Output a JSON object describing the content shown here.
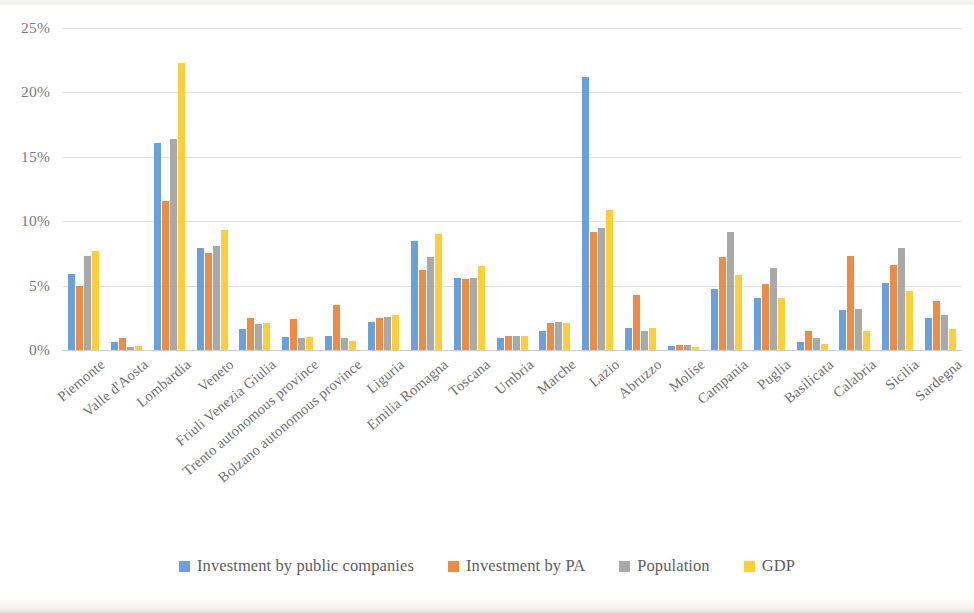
{
  "chart_data": {
    "type": "bar",
    "title": "",
    "subtitle": "",
    "xlabel": "",
    "ylabel": "",
    "ylim": [
      0,
      25
    ],
    "y_tick_step": 5,
    "grid": true,
    "legend_position": "bottom",
    "y_ticks": [
      "0%",
      "5%",
      "10%",
      "15%",
      "20%",
      "25%"
    ],
    "categories": [
      "Piemonte",
      "Valle d'Aosta",
      "Lombardia",
      "Veneto",
      "Friuli Venezia Giulia",
      "Trento autonomous province",
      "Bolzano autonomous province",
      "Liguria",
      "Emilia Romagna",
      "Toscana",
      "Umbria",
      "Marche",
      "Lazio",
      "Abruzzo",
      "Molise",
      "Campania",
      "Puglia",
      "Basilicata",
      "Calabria",
      "Sicilia",
      "Sardegna"
    ],
    "series": [
      {
        "name": "Investment by public companies",
        "color": "#67A2DC",
        "values": [
          5.9,
          0.6,
          16.1,
          7.9,
          1.6,
          1.0,
          1.1,
          2.2,
          8.5,
          5.6,
          0.9,
          1.5,
          21.2,
          1.7,
          0.3,
          4.7,
          4.0,
          0.6,
          3.1,
          5.2,
          2.5
        ]
      },
      {
        "name": "Investment by PA",
        "color": "#F08B43",
        "values": [
          5.0,
          0.9,
          11.6,
          7.5,
          2.5,
          2.4,
          3.5,
          2.5,
          6.2,
          5.5,
          1.1,
          2.1,
          9.2,
          4.3,
          0.4,
          7.2,
          5.1,
          1.5,
          7.3,
          6.6,
          3.8
        ]
      },
      {
        "name": "Population",
        "color": "#A9A9A9",
        "values": [
          7.3,
          0.2,
          16.4,
          8.1,
          2.0,
          0.9,
          0.9,
          2.6,
          7.2,
          5.6,
          1.1,
          2.2,
          9.5,
          1.5,
          0.4,
          9.2,
          6.4,
          0.9,
          3.2,
          7.9,
          2.7
        ]
      },
      {
        "name": "GDP",
        "color": "#FFCF3A",
        "values": [
          7.7,
          0.3,
          22.3,
          9.3,
          2.1,
          1.0,
          0.7,
          2.7,
          9.0,
          6.5,
          1.1,
          2.1,
          10.9,
          1.7,
          0.2,
          5.8,
          4.0,
          0.5,
          1.5,
          4.6,
          1.6
        ]
      }
    ]
  }
}
